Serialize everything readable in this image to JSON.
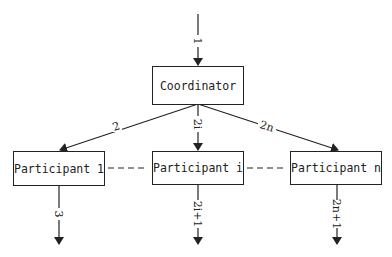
{
  "diagram": {
    "nodes": {
      "coordinator": "Coordinator",
      "participant_1": "Participant 1",
      "participant_i": "Participant i",
      "participant_n": "Participant n"
    },
    "edges": {
      "in": "1",
      "to_p1": "2",
      "to_pi": "2i",
      "to_pn": "2n",
      "out_p1": "3",
      "out_pi": "2i+1",
      "out_pn": "2n+1"
    },
    "colors": {
      "stroke": "#222222",
      "background": "#ffffff"
    }
  }
}
